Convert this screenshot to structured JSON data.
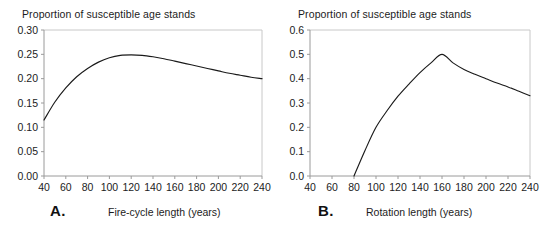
{
  "figure": {
    "background_color": "#ffffff",
    "axis_color": "#9a9a9a",
    "curve_color": "#1a1a1a",
    "panels": [
      "A",
      "B"
    ]
  },
  "chart_data": [
    {
      "type": "line",
      "panel_label": "A.",
      "title": "Proportion of susceptible age stands",
      "xlabel": "Fire-cycle length (years)",
      "ylabel": "",
      "xlim": [
        40,
        240
      ],
      "ylim": [
        0.0,
        0.3
      ],
      "grid": false,
      "legend": "none",
      "xticks": [
        40,
        60,
        80,
        100,
        120,
        140,
        160,
        180,
        200,
        220,
        240
      ],
      "xticklabels": [
        "40",
        "60",
        "80",
        "100",
        "120",
        "140",
        "160",
        "180",
        "200",
        "220",
        "240"
      ],
      "yticks": [
        0.0,
        0.05,
        0.1,
        0.15,
        0.2,
        0.25,
        0.3
      ],
      "yticklabels": [
        "0.00",
        "0.05",
        "0.10",
        "0.15",
        "0.20",
        "0.25",
        "0.30"
      ],
      "series": [
        {
          "name": "Proportion of susceptible age stands",
          "x": [
            40,
            50,
            60,
            70,
            80,
            90,
            100,
            110,
            120,
            130,
            140,
            150,
            160,
            170,
            180,
            190,
            200,
            210,
            220,
            230,
            240
          ],
          "values": [
            0.115,
            0.152,
            0.181,
            0.204,
            0.221,
            0.234,
            0.243,
            0.248,
            0.249,
            0.248,
            0.245,
            0.241,
            0.236,
            0.231,
            0.226,
            0.221,
            0.216,
            0.211,
            0.207,
            0.203,
            0.2
          ]
        }
      ]
    },
    {
      "type": "line",
      "panel_label": "B.",
      "title": "Proportion of susceptible age stands",
      "xlabel": "Rotation length (years)",
      "ylabel": "",
      "xlim": [
        40,
        240
      ],
      "ylim": [
        0.0,
        0.6
      ],
      "grid": false,
      "legend": "none",
      "xticks": [
        40,
        60,
        80,
        100,
        120,
        140,
        160,
        180,
        200,
        220,
        240
      ],
      "xticklabels": [
        "40",
        "60",
        "80",
        "100",
        "120",
        "140",
        "160",
        "180",
        "200",
        "220",
        "240"
      ],
      "yticks": [
        0.0,
        0.1,
        0.2,
        0.3,
        0.4,
        0.5,
        0.6
      ],
      "yticklabels": [
        "0.0",
        "0.1",
        "0.2",
        "0.3",
        "0.4",
        "0.5",
        "0.6"
      ],
      "series": [
        {
          "name": "Proportion of susceptible age stands",
          "x": [
            80,
            90,
            100,
            110,
            120,
            130,
            140,
            150,
            160,
            170,
            180,
            190,
            200,
            210,
            220,
            230,
            240
          ],
          "values": [
            0.0,
            0.105,
            0.2,
            0.268,
            0.328,
            0.378,
            0.425,
            0.465,
            0.5,
            0.465,
            0.438,
            0.418,
            0.4,
            0.382,
            0.366,
            0.348,
            0.33
          ]
        }
      ]
    }
  ]
}
